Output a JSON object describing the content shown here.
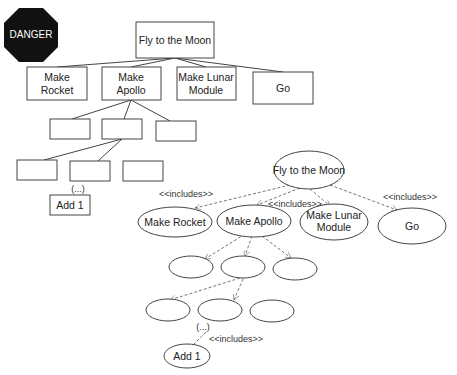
{
  "danger_sign": {
    "label": "DANGER",
    "color": "#111111"
  },
  "tree_diagram": {
    "root": "Fly to the Moon",
    "level1": [
      "Make Rocket",
      "Make\nApollo",
      "Make Lunar\nModule",
      "Go"
    ],
    "level1_lines": {
      "rocket": [
        "Make",
        "Rocket"
      ],
      "apollo": [
        "Make",
        "Apollo"
      ],
      "lunar": [
        "Make Lunar",
        "Module"
      ],
      "go": [
        "Go"
      ]
    },
    "level2": [
      "",
      "",
      ""
    ],
    "level3": [
      "",
      "",
      ""
    ],
    "ellipsis": "(...)",
    "leaf": "Add 1"
  },
  "use_case_diagram": {
    "root": "Fly to the Moon",
    "level1": {
      "rocket": "Make Rocket",
      "apollo": "Make Apollo",
      "lunar_line1": "Make Lunar",
      "lunar_line2": "Module",
      "go": "Go"
    },
    "relation_label": "<<includes>>",
    "ellipsis": "(...)",
    "leaf": "Add 1"
  }
}
